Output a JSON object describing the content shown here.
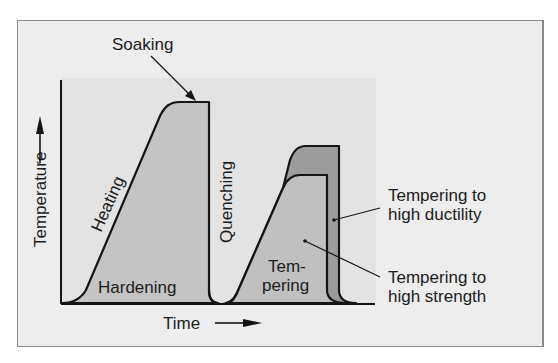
{
  "diagram": {
    "axes": {
      "x_label": "Time",
      "y_label": "Temperature"
    },
    "phases": {
      "soaking": "Soaking",
      "heating": "Heating",
      "hardening": "Hardening",
      "quenching": "Quenching",
      "tempering_line1": "Tem-",
      "tempering_line2": "pering"
    },
    "callouts": {
      "ductility_line1": "Tempering to",
      "ductility_line2": "high ductility",
      "strength_line1": "Tempering to",
      "strength_line2": "high strength"
    },
    "colors": {
      "frame_bg": "#ededed",
      "plot_bg": "#e3e3e3",
      "hardening_fill": "#c4c4c4",
      "ductility_fill": "#9c9c9c",
      "strength_fill": "#c0c0c0",
      "line": "#151515"
    }
  }
}
